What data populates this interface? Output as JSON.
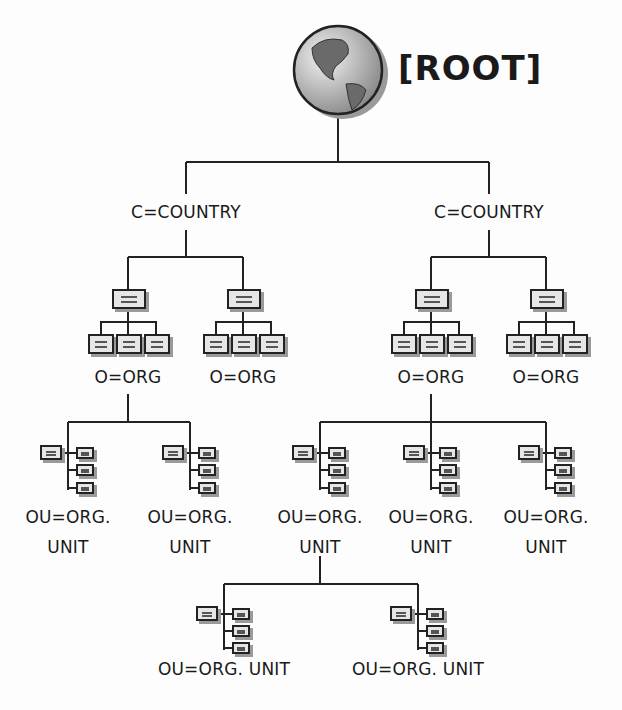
{
  "root": {
    "label": "[ROOT]",
    "icon": "globe-icon"
  },
  "countries": [
    {
      "label": "C=COUNTRY"
    },
    {
      "label": "C=COUNTRY"
    }
  ],
  "orgs": [
    {
      "label": "O=ORG"
    },
    {
      "label": "O=ORG"
    },
    {
      "label": "O=ORG"
    },
    {
      "label": "O=ORG"
    }
  ],
  "org_units": [
    {
      "line1": "OU=ORG.",
      "line2": "UNIT"
    },
    {
      "line1": "OU=ORG.",
      "line2": "UNIT"
    },
    {
      "line1": "OU=ORG.",
      "line2": "UNIT"
    },
    {
      "line1": "OU=ORG.",
      "line2": "UNIT"
    },
    {
      "line1": "OU=ORG.",
      "line2": "UNIT"
    }
  ],
  "sub_org_units": [
    {
      "label": "OU=ORG. UNIT"
    },
    {
      "label": "OU=ORG. UNIT"
    }
  ],
  "colors": {
    "line": "#222222",
    "box_fill": "#e6e6e6",
    "shadow": "#9a9a9a"
  }
}
